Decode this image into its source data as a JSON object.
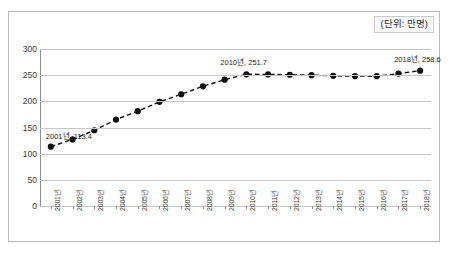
{
  "caption": {
    "unit_label": "(단위: 만명)"
  },
  "chart_data": {
    "type": "line",
    "title": "",
    "subtitle": "",
    "xlabel": "",
    "ylabel": "",
    "unit": "만명",
    "grid": true,
    "legend_position": "none",
    "ylim": [
      0,
      300
    ],
    "yticks": [
      0,
      50,
      100,
      150,
      200,
      250,
      300
    ],
    "ytick_labels": [
      "0",
      "50",
      "100",
      "150",
      "200",
      "250",
      "300"
    ],
    "categories": [
      "2001년",
      "2002년",
      "2003년",
      "2004년",
      "2005년",
      "2006년",
      "2007년",
      "2008년",
      "2009년",
      "2010년",
      "2011년",
      "2012년",
      "2013년",
      "2014년",
      "2015년",
      "2016년",
      "2017년",
      "2018년"
    ],
    "values": [
      113.4,
      127.3,
      144.7,
      165.2,
      181.2,
      199.1,
      213.5,
      228.7,
      241.3,
      251.7,
      251.5,
      250.8,
      249.9,
      248.7,
      248.2,
      248.0,
      253.0,
      258.6
    ],
    "series": [
      {
        "name": "등록인구",
        "marker": "circle",
        "linestyle": "dashed",
        "color": "#111111",
        "values": [
          113.4,
          127.3,
          144.7,
          165.2,
          181.2,
          199.1,
          213.5,
          228.7,
          241.3,
          251.7,
          251.5,
          250.8,
          249.9,
          248.7,
          248.2,
          248.0,
          253.0,
          258.6
        ]
      }
    ],
    "annotations": [
      {
        "text": "2001년, 113.4",
        "category": "2001년",
        "value": 113.4
      },
      {
        "text": "2010년, 251.7",
        "category": "2010년",
        "value": 251.7
      },
      {
        "text": "2018년, 258.6",
        "category": "2018년",
        "value": 258.6
      }
    ],
    "colors": {
      "line": "#111111",
      "marker": "#0d0d0d",
      "gridline": "#c6c6c6",
      "axis": "#8f8f8f",
      "text": "#3a3a3a",
      "frame": "#b9b9b9"
    }
  }
}
